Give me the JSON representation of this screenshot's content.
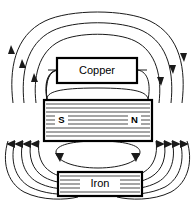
{
  "figure": {
    "name": "magnetic-flux-diagram",
    "background_color": "#ffffff",
    "line_color": "#1a1a1a",
    "width": 195,
    "height": 203
  },
  "blocks": {
    "copper": {
      "label": "Copper",
      "x": 57,
      "y": 58,
      "width": 80,
      "height": 25,
      "hatched": false
    },
    "magnet": {
      "label": "",
      "south_pole_label": "S",
      "north_pole_label": "N",
      "x": 44,
      "y": 100,
      "width": 108,
      "height": 41,
      "hatched": true
    },
    "iron": {
      "label": "Iron",
      "x": 58,
      "y": 172,
      "width": 84,
      "height": 24,
      "hatched": true
    }
  },
  "flux": {
    "upper_loops_count": 4,
    "lower_loops_count": 5,
    "inner_loop_present": true,
    "arrow_groups": [
      {
        "name": "upper-left-arrows",
        "direction": "up",
        "count": 3
      },
      {
        "name": "upper-right-arrows",
        "direction": "down",
        "count": 3
      },
      {
        "name": "lower-left-arrows",
        "direction": "left",
        "count": 4
      },
      {
        "name": "lower-right-arrows",
        "direction": "right",
        "count": 4
      },
      {
        "name": "inner-loop-arrows",
        "direction": "clockwise",
        "count": 2
      }
    ]
  }
}
